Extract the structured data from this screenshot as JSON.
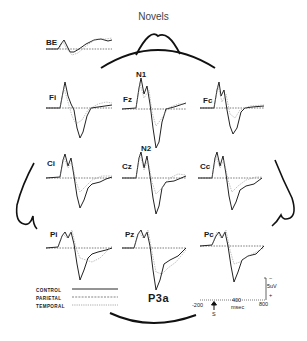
{
  "figure": {
    "title": "Novels",
    "components": {
      "n1": "N1",
      "n2": "N2",
      "p3a": "P3a"
    },
    "electrodes": [
      {
        "id": "BE",
        "label": "BE"
      },
      {
        "id": "Fi",
        "label": "Fi"
      },
      {
        "id": "Fz",
        "label": "Fz"
      },
      {
        "id": "Fc",
        "label": "Fc"
      },
      {
        "id": "Ci",
        "label": "Ci"
      },
      {
        "id": "Cz",
        "label": "Cz"
      },
      {
        "id": "Cc",
        "label": "Cc"
      },
      {
        "id": "Pi",
        "label": "Pi"
      },
      {
        "id": "Pz",
        "label": "Pz"
      },
      {
        "id": "Pc",
        "label": "Pc"
      }
    ],
    "legend": [
      {
        "name": "CONTROL",
        "style": "solid"
      },
      {
        "name": "PARIETAL",
        "style": "dashed"
      },
      {
        "name": "TEMPORAL",
        "style": "dotted"
      }
    ],
    "scale": {
      "x_ticks": [
        "-200",
        "400",
        "800"
      ],
      "x_unit": "msec",
      "stimulus_marker": "S",
      "y_scale": "5uV",
      "y_minus": "−",
      "y_plus": "+"
    },
    "colors": {
      "ink": "#1a1a1a",
      "gray_trace": "#9a9a9a",
      "background": "#ffffff"
    }
  }
}
